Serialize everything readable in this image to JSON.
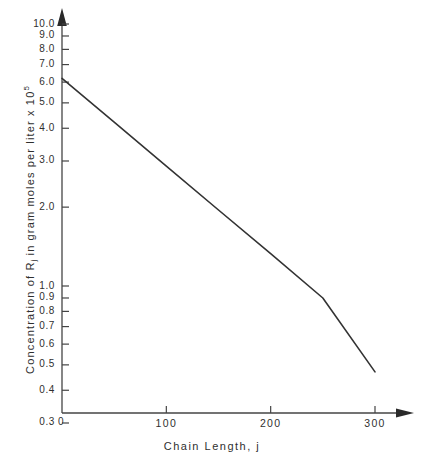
{
  "chart_data": {
    "type": "line",
    "title": "",
    "xlabel": "Chain Length, j",
    "ylabel_parts": {
      "lead": "Concentration of R",
      "sub": "j",
      "mid": " in gram moles per liter x 10",
      "sup": "5"
    },
    "ylabel": "Concentration of Rj in gram moles per liter x 10^5",
    "yscale": "log",
    "xscale": "linear",
    "grid": false,
    "legend": null,
    "xlim": [
      0,
      330
    ],
    "ylim": [
      0.3,
      10.0
    ],
    "xticks": [
      {
        "value": 0,
        "label": "0"
      },
      {
        "value": 100,
        "label": "100"
      },
      {
        "value": 200,
        "label": "200"
      },
      {
        "value": 300,
        "label": "300"
      }
    ],
    "yticks": [
      {
        "value": 10.0,
        "label": "10.0"
      },
      {
        "value": 9.0,
        "label": "9.0"
      },
      {
        "value": 8.0,
        "label": "8.0"
      },
      {
        "value": 7.0,
        "label": "7.0"
      },
      {
        "value": 6.0,
        "label": "6.0"
      },
      {
        "value": 5.0,
        "label": "5.0"
      },
      {
        "value": 4.0,
        "label": "4.0"
      },
      {
        "value": 3.0,
        "label": "3.0"
      },
      {
        "value": 2.0,
        "label": "2.0"
      },
      {
        "value": 1.0,
        "label": "1.0"
      },
      {
        "value": 0.9,
        "label": "0.9"
      },
      {
        "value": 0.8,
        "label": "0.8"
      },
      {
        "value": 0.7,
        "label": "0.7"
      },
      {
        "value": 0.6,
        "label": "0.6"
      },
      {
        "value": 0.5,
        "label": "0.5"
      },
      {
        "value": 0.4,
        "label": "0.4"
      },
      {
        "value": 0.3,
        "label": "0.3"
      }
    ],
    "series": [
      {
        "name": "Rj concentration",
        "x": [
          0,
          50,
          100,
          150,
          200,
          250,
          300
        ],
        "y": [
          6.2,
          4.22,
          2.87,
          1.95,
          1.33,
          0.9,
          0.47
        ],
        "color": "#333333"
      }
    ],
    "axis_color": "#444444",
    "line_color": "#333333",
    "background": "#ffffff"
  }
}
